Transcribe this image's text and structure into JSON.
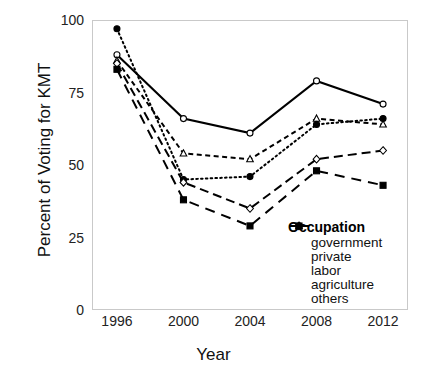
{
  "chart_data": {
    "type": "line",
    "title": "",
    "xlabel": "Year",
    "ylabel": "Percent of Voting for KMT",
    "x": [
      1996,
      2000,
      2004,
      2008,
      2012
    ],
    "xtick_labels": [
      "1996",
      "2000",
      "2004",
      "2008",
      "2012"
    ],
    "ytick_labels": [
      "0",
      "25",
      "50",
      "75",
      "100"
    ],
    "ytick_values": [
      0,
      25,
      50,
      75,
      100
    ],
    "ylim": [
      0,
      100
    ],
    "xlim": [
      1994.5,
      2013.5
    ],
    "grid": false,
    "legend_position": "inside-lower-right",
    "legend_title": "Occupation",
    "series": [
      {
        "name": "government",
        "values": [
          88,
          66,
          61,
          79,
          71
        ],
        "style": "solid",
        "marker": "circle-open"
      },
      {
        "name": "private",
        "values": [
          86,
          54,
          52,
          66,
          64
        ],
        "style": "dashed",
        "marker": "triangle-open"
      },
      {
        "name": "labor",
        "values": [
          97,
          45,
          46,
          64,
          66
        ],
        "style": "dotted",
        "marker": "circle-filled"
      },
      {
        "name": "agriculture",
        "values": [
          85,
          44,
          35,
          52,
          55
        ],
        "style": "longdash",
        "marker": "diamond-open"
      },
      {
        "name": "others",
        "values": [
          83,
          38,
          29,
          48,
          43
        ],
        "style": "dashed-wide",
        "marker": "square-filled"
      }
    ]
  },
  "axes": {
    "y_title": "Percent of Voting for KMT",
    "x_title": "Year"
  },
  "legend": {
    "title": "Occupation",
    "items": [
      {
        "label": "government"
      },
      {
        "label": "private"
      },
      {
        "label": "labor"
      },
      {
        "label": "agriculture"
      },
      {
        "label": "others"
      }
    ]
  }
}
